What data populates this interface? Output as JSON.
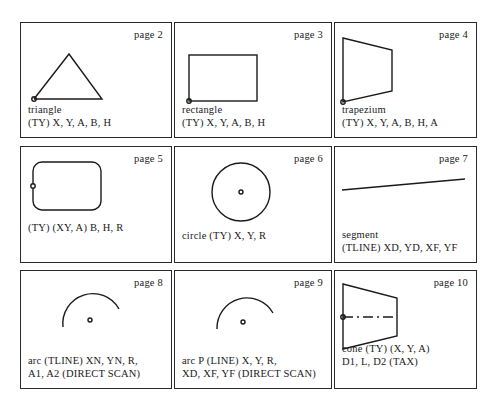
{
  "panels": [
    {
      "page": "page 2",
      "shape": "triangle",
      "caption": [
        "triangle",
        "(TY) X, Y, A, B, H"
      ]
    },
    {
      "page": "page 3",
      "shape": "rectangle",
      "caption": [
        "rectangle",
        "(TY) X, Y, A, B, H"
      ]
    },
    {
      "page": "page 4",
      "shape": "trapezium",
      "caption": [
        "trapezium",
        "(TY) X, Y, A, B, H, A"
      ]
    },
    {
      "page": "page 5",
      "shape": "rounded-rectangle",
      "caption": [
        "(TY) (XY, A) B, H, R"
      ]
    },
    {
      "page": "page 6",
      "shape": "circle",
      "caption": [
        "circle (TY) X, Y, R"
      ]
    },
    {
      "page": "page 7",
      "shape": "segment",
      "caption": [
        "segment",
        "(TLINE) XD, YD, XF, YF"
      ]
    },
    {
      "page": "page 8",
      "shape": "arc",
      "caption": [
        "arc (TLINE) XN, YN, R,",
        "A1, A2 (DIRECT SCAN)"
      ]
    },
    {
      "page": "page 9",
      "shape": "arc-p",
      "caption": [
        "arc P (LINE) X, Y, R,",
        "XD, XF, YF (DIRECT SCAN)"
      ]
    },
    {
      "page": "page 10",
      "shape": "cone",
      "caption": [
        "cone (TY) (X, Y, A)",
        "D1, L, D2 (TAX)"
      ]
    }
  ]
}
